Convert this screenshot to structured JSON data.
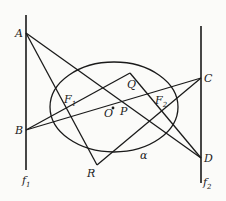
{
  "figure": {
    "type": "geometry-diagram",
    "lines": {
      "f1": {
        "label": "f",
        "sub": "1",
        "x": 26,
        "y1": 15,
        "y2": 170
      },
      "f2": {
        "label": "f",
        "sub": "2",
        "x": 201,
        "y1": 26,
        "y2": 183
      }
    },
    "ellipse": {
      "label": "α",
      "cx": 114,
      "cy": 107,
      "rx": 64,
      "ry": 45
    },
    "points": {
      "A": {
        "label": "A",
        "x": 26,
        "y": 33
      },
      "B": {
        "label": "B",
        "x": 26,
        "y": 130
      },
      "C": {
        "label": "C",
        "x": 201,
        "y": 78
      },
      "D": {
        "label": "D",
        "x": 201,
        "y": 158
      },
      "Q": {
        "label": "Q",
        "x": 130,
        "y": 73
      },
      "R": {
        "label": "R",
        "x": 97,
        "y": 165
      },
      "F1": {
        "label": "F",
        "sub": "1",
        "x": 66,
        "y": 107
      },
      "F2": {
        "label": "F",
        "sub": "2",
        "x": 162,
        "y": 107
      },
      "P": {
        "label": "P",
        "x": 121,
        "y": 101
      },
      "O": {
        "label": "O",
        "x": 114,
        "y": 107
      }
    },
    "segments": [
      [
        "A",
        "R"
      ],
      [
        "A",
        "D"
      ],
      [
        "B",
        "Q"
      ],
      [
        "B",
        "C"
      ],
      [
        "C",
        "R"
      ],
      [
        "Q",
        "D"
      ]
    ]
  }
}
